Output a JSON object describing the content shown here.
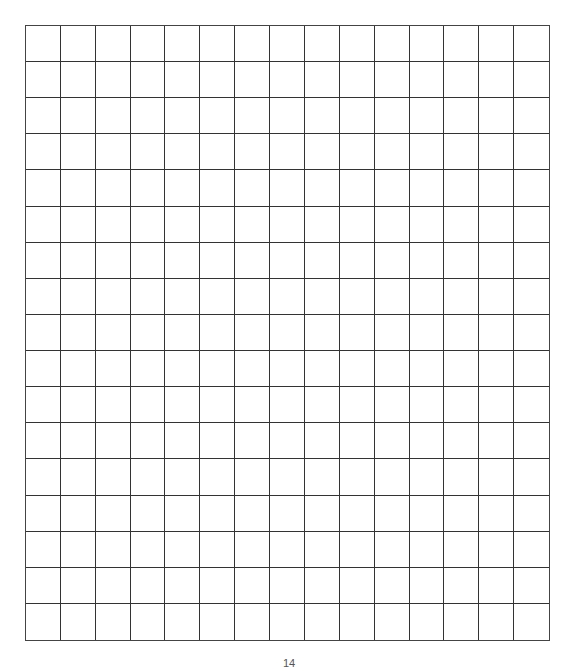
{
  "page": {
    "type": "graph-paper",
    "grid": {
      "columns": 15,
      "rows": 17,
      "line_color": "#333333"
    },
    "page_number": "14"
  }
}
